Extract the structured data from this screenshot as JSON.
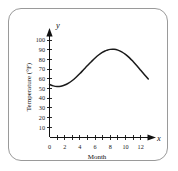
{
  "figure": {
    "border_color": "#9a9a9a",
    "background_color": "#ffffff"
  },
  "axes": {
    "y_variable_label": "y",
    "x_variable_label": "x",
    "y_axis_title": "Temperature (°F)",
    "x_axis_title": "Month"
  },
  "chart_data": {
    "type": "line",
    "title": "",
    "subtitle": "",
    "xlabel": "Month",
    "ylabel": "Temperature (°F)",
    "x_variable": "x",
    "y_variable": "y",
    "xlim": [
      0,
      13.8
    ],
    "ylim": [
      0,
      108
    ],
    "grid": false,
    "legend": null,
    "x_major_ticks": [
      0,
      2,
      4,
      6,
      8,
      10,
      12
    ],
    "x_minor_ticks": [
      1,
      3,
      5,
      7,
      9,
      11,
      13
    ],
    "x_tick_labels": [
      "0",
      "2",
      "4",
      "6",
      "8",
      "10",
      "12"
    ],
    "y_major_ticks": [
      10,
      20,
      30,
      40,
      50,
      60,
      70,
      80,
      90,
      100
    ],
    "y_tick_labels": [
      "10",
      "20",
      "30",
      "40",
      "50",
      "60",
      "70",
      "80",
      "90",
      "100"
    ],
    "series": [
      {
        "name": "Average monthly temperature",
        "x": [
          0,
          0.5,
          1,
          1.5,
          2,
          2.5,
          3,
          3.5,
          4,
          4.5,
          5,
          5.5,
          6,
          6.5,
          7,
          7.3,
          7.5,
          8,
          8.5,
          9,
          9.5,
          10,
          10.5,
          11,
          11.5,
          12,
          12.5,
          13
        ],
        "values": [
          52,
          50.6,
          50.0,
          50.3,
          51.4,
          53.3,
          55.9,
          59.1,
          62.7,
          66.6,
          70.5,
          74.3,
          77.9,
          81.1,
          83.7,
          84.8,
          85.4,
          86.4,
          86.5,
          85.7,
          84.0,
          81.5,
          78.3,
          74.5,
          70.4,
          66.0,
          61.6,
          57.3
        ]
      }
    ],
    "annotations": []
  }
}
